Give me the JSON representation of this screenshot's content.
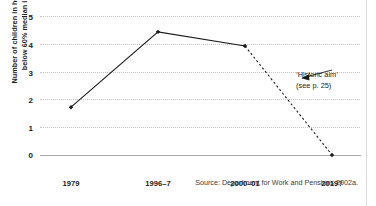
{
  "chart_data": {
    "type": "line",
    "title": "",
    "xlabel": "",
    "ylabel": "Number of children in households\nbelow 60% median income",
    "categories": [
      "1979",
      "1996–7",
      "2000–01",
      "2019?"
    ],
    "ylim": [
      0,
      5
    ],
    "yticks": [
      "0",
      "1",
      "2",
      "3",
      "4",
      "5"
    ],
    "grid": "horizontal dotted gridlines at 1,2,3,4,5; solid axis line at 0",
    "legend": "none",
    "series": [
      {
        "name": "Number of children in households below 60% median income (millions)",
        "values": [
          1.72,
          4.43,
          3.92,
          0
        ],
        "segments": [
          {
            "style": "solid",
            "from": "1979",
            "to": "1996–7"
          },
          {
            "style": "solid",
            "from": "1996–7",
            "to": "2000–01"
          },
          {
            "style": "dashed",
            "from": "2000–01",
            "to": "2019?"
          }
        ],
        "marker": "filled diamond",
        "color": "#1b1b1b"
      }
    ],
    "annotations": [
      {
        "name": "historic-aim",
        "line1": "‘Historic aim’",
        "line2": "(see p. 25)",
        "leader": "arrow pointing left to the dashed projection line"
      }
    ],
    "source_note": "Source: Department for Work and Pensions 2002a.",
    "colors": {
      "line": "#1b1b1b",
      "grid": "#c3c3c9",
      "axis": "#a7a7ad",
      "text": "#1b1b1b",
      "background": "#ffffff"
    }
  }
}
